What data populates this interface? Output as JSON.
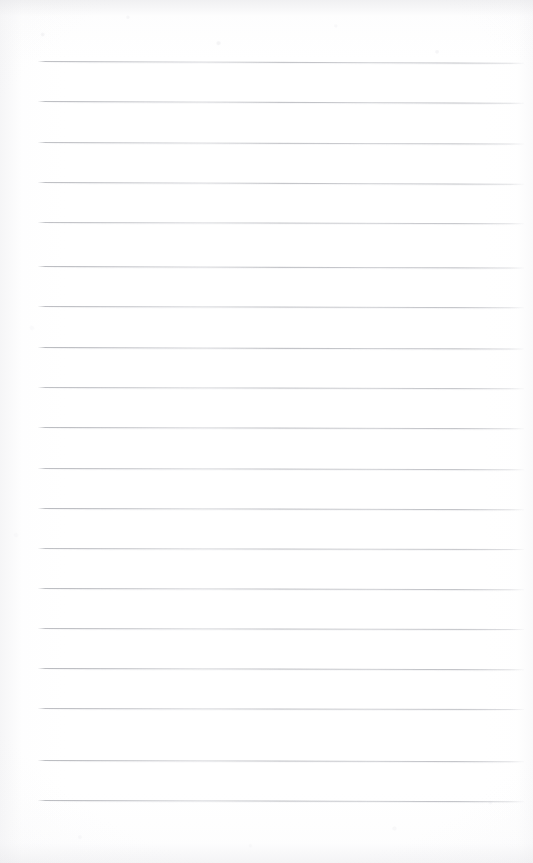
{
  "document": {
    "title": "Scanned Lined Page",
    "type": "blank-ruled-notebook-page",
    "description": "Scanned blank sheet of ruled writing paper with no handwriting or printed text",
    "text_content": "",
    "page_width": 533,
    "page_height": 863,
    "paper_color": "#ffffff",
    "rule_color": "#9b9da4",
    "rule_left_x": 38,
    "rule_right_x": 524,
    "rule_spacing": 40,
    "rule_count": 19,
    "tilt_degrees": 0.18,
    "rules": [
      {
        "index": 1,
        "y": 61,
        "tilt": 0.22,
        "opacity": 0.8
      },
      {
        "index": 2,
        "y": 101,
        "tilt": 0.2,
        "opacity": 0.82
      },
      {
        "index": 3,
        "y": 142,
        "tilt": 0.18,
        "opacity": 0.78
      },
      {
        "index": 4,
        "y": 182,
        "tilt": 0.2,
        "opacity": 0.8
      },
      {
        "index": 5,
        "y": 222,
        "tilt": 0.16,
        "opacity": 0.76
      },
      {
        "index": 6,
        "y": 266,
        "tilt": 0.18,
        "opacity": 0.84
      },
      {
        "index": 7,
        "y": 306,
        "tilt": 0.16,
        "opacity": 0.8
      },
      {
        "index": 8,
        "y": 347,
        "tilt": 0.18,
        "opacity": 0.86
      },
      {
        "index": 9,
        "y": 387,
        "tilt": 0.14,
        "opacity": 0.78
      },
      {
        "index": 10,
        "y": 427,
        "tilt": 0.16,
        "opacity": 0.82
      },
      {
        "index": 11,
        "y": 468,
        "tilt": 0.14,
        "opacity": 0.8
      },
      {
        "index": 12,
        "y": 508,
        "tilt": 0.16,
        "opacity": 0.84
      },
      {
        "index": 13,
        "y": 548,
        "tilt": 0.12,
        "opacity": 0.78
      },
      {
        "index": 14,
        "y": 588,
        "tilt": 0.14,
        "opacity": 0.82
      },
      {
        "index": 15,
        "y": 628,
        "tilt": 0.12,
        "opacity": 0.8
      },
      {
        "index": 16,
        "y": 668,
        "tilt": 0.14,
        "opacity": 0.84
      },
      {
        "index": 17,
        "y": 708,
        "tilt": 0.12,
        "opacity": 0.8
      },
      {
        "index": 18,
        "y": 760,
        "tilt": 0.14,
        "opacity": 0.82
      },
      {
        "index": 19,
        "y": 800,
        "tilt": 0.16,
        "opacity": 0.86
      }
    ]
  }
}
